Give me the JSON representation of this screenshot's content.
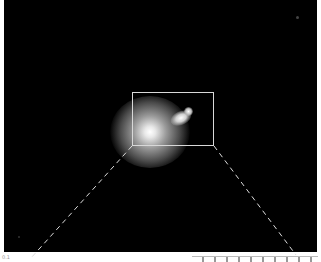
{
  "figure": {
    "background_color": "#000000",
    "inset_box": {
      "left": 132,
      "top": 92,
      "width": 82,
      "height": 54,
      "color": "#d8d8d8"
    },
    "connectors": [
      {
        "x1": 132,
        "y1": 146,
        "x2": 31,
        "y2": 258
      },
      {
        "x1": 214,
        "y1": 146,
        "x2": 296,
        "y2": 255
      }
    ],
    "sources": [
      {
        "name": "main-galaxy",
        "cx": 150,
        "cy": 130,
        "r": 28
      },
      {
        "name": "companion",
        "cx": 180,
        "cy": 118,
        "r": 6
      },
      {
        "name": "companion-knot",
        "cx": 189,
        "cy": 112,
        "r": 3
      }
    ],
    "bottom_label": "0.1",
    "next_panel_ticks": "▁▂▁▂▁▂▁▂▂▂▂▂"
  }
}
